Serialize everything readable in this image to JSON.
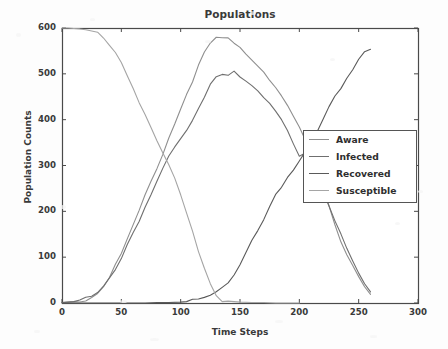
{
  "chart_data": {
    "type": "line",
    "title": "Populations",
    "xlabel": "Time Steps",
    "ylabel": "Population Counts",
    "xlim": [
      0,
      300
    ],
    "ylim": [
      0,
      600
    ],
    "xticks": [
      0,
      50,
      100,
      150,
      200,
      250,
      300
    ],
    "yticks": [
      0,
      100,
      200,
      300,
      400,
      500,
      600
    ],
    "grid": false,
    "legend_position": "center right",
    "series": [
      {
        "name": "Aware",
        "color": "#8f8f8f",
        "x": [
          0,
          5,
          10,
          15,
          20,
          25,
          30,
          35,
          40,
          45,
          50,
          55,
          60,
          65,
          70,
          75,
          80,
          85,
          90,
          95,
          100,
          105,
          110,
          115,
          120,
          125,
          130,
          135,
          140,
          145,
          150,
          155,
          160,
          165,
          170,
          175,
          180,
          185,
          190,
          195,
          200,
          205,
          210,
          215,
          220,
          225,
          230,
          235,
          240,
          245,
          250,
          255,
          260
        ],
        "values": [
          1,
          2,
          3,
          5,
          8,
          13,
          22,
          38,
          58,
          82,
          108,
          137,
          168,
          200,
          232,
          264,
          296,
          328,
          360,
          392,
          424,
          456,
          487,
          516,
          543,
          566,
          576,
          578,
          574,
          566,
          556,
          545,
          533,
          520,
          506,
          490,
          472,
          452,
          430,
          406,
          380,
          352,
          318,
          282,
          245,
          208,
          172,
          138,
          108,
          82,
          58,
          38,
          22
        ]
      },
      {
        "name": "Infected",
        "color": "#6f6f6f",
        "x": [
          0,
          5,
          10,
          15,
          20,
          25,
          30,
          35,
          40,
          45,
          50,
          55,
          60,
          65,
          70,
          75,
          80,
          85,
          90,
          95,
          100,
          105,
          110,
          115,
          120,
          125,
          130,
          135,
          140,
          145,
          150,
          155,
          160,
          165,
          170,
          175,
          180,
          185,
          190,
          195,
          200,
          205,
          210,
          215,
          220,
          225,
          230,
          235,
          240,
          245,
          250,
          255,
          260
        ],
        "values": [
          1,
          2,
          3,
          5,
          8,
          12,
          20,
          34,
          52,
          75,
          100,
          128,
          155,
          182,
          210,
          238,
          266,
          292,
          316,
          338,
          356,
          374,
          398,
          424,
          452,
          478,
          496,
          503,
          499,
          507,
          498,
          486,
          474,
          461,
          447,
          432,
          415,
          396,
          374,
          350,
          323,
          330,
          312,
          280,
          246,
          212,
          178,
          146,
          116,
          88,
          62,
          40,
          22
        ]
      },
      {
        "name": "Recovered",
        "color": "#5a5a5a",
        "x": [
          0,
          10,
          20,
          30,
          40,
          50,
          60,
          70,
          80,
          90,
          100,
          105,
          110,
          115,
          120,
          125,
          130,
          135,
          140,
          145,
          150,
          155,
          160,
          165,
          170,
          175,
          180,
          185,
          190,
          195,
          200,
          205,
          210,
          215,
          220,
          225,
          230,
          235,
          240,
          245,
          250,
          255,
          260
        ],
        "values": [
          0,
          0,
          0,
          0,
          0,
          0,
          0,
          0,
          1,
          1,
          2,
          3,
          5,
          8,
          12,
          16,
          22,
          32,
          48,
          66,
          88,
          112,
          138,
          162,
          186,
          210,
          232,
          252,
          270,
          288,
          306,
          326,
          350,
          378,
          404,
          430,
          452,
          472,
          492,
          512,
          530,
          545,
          553
        ]
      },
      {
        "name": "Susceptible",
        "color": "#a5a5a5",
        "x": [
          0,
          5,
          10,
          15,
          20,
          25,
          30,
          35,
          40,
          45,
          50,
          55,
          60,
          65,
          70,
          75,
          80,
          85,
          90,
          95,
          100,
          105,
          110,
          115,
          120,
          125,
          130,
          135,
          140,
          145,
          150,
          160,
          170,
          180,
          190,
          200
        ],
        "values": [
          600,
          600,
          599,
          598,
          596,
          592,
          586,
          576,
          562,
          544,
          522,
          497,
          470,
          442,
          414,
          386,
          358,
          330,
          300,
          268,
          232,
          194,
          152,
          110,
          72,
          40,
          16,
          6,
          4,
          3,
          2,
          1,
          1,
          0,
          0,
          0
        ]
      }
    ]
  },
  "axes": {
    "yticks": [
      "0",
      "100",
      "200",
      "300",
      "400",
      "500",
      "600"
    ],
    "xticks": [
      "0",
      "50",
      "100",
      "150",
      "200",
      "250",
      "300"
    ]
  },
  "legend": {
    "entries": [
      {
        "label": "Aware",
        "color": "#8f8f8f"
      },
      {
        "label": "Infected",
        "color": "#6f6f6f"
      },
      {
        "label": "Recovered",
        "color": "#5a5a5a"
      },
      {
        "label": "Susceptible",
        "color": "#a5a5a5"
      }
    ]
  },
  "style": {
    "axis_color": "#4a4a4a",
    "text_color": "#3a3a3a",
    "background": "#fdfdfd"
  }
}
